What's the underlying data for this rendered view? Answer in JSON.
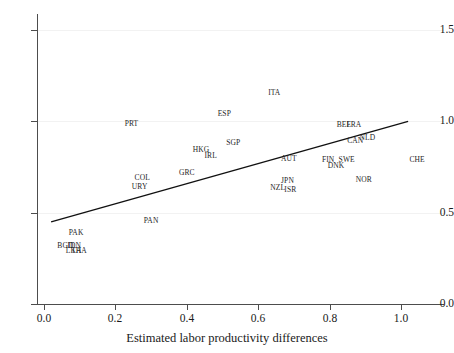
{
  "chart_data": {
    "type": "scatter",
    "title": "",
    "subtitle": "",
    "xlabel": "Estimated labor productivity differences",
    "ylabel": "",
    "xlim": [
      -0.02,
      1.12
    ],
    "ylim": [
      0.0,
      1.58
    ],
    "xticks": [
      "0.0",
      "0.2",
      "0.4",
      "0.6",
      "0.8",
      "1.0"
    ],
    "xtick_values": [
      0.0,
      0.2,
      0.4,
      0.6,
      0.8,
      1.0
    ],
    "yticks": [
      "0.0",
      "0.5",
      "1.0",
      "1.5"
    ],
    "ytick_values": [
      0.0,
      0.5,
      1.0,
      1.5
    ],
    "grid": true,
    "grid_axis": "y",
    "legend": "none",
    "marker_style": "text-label-only",
    "point_label_field": "label",
    "points": [
      {
        "label": "ITA",
        "x": 0.645,
        "y": 1.155
      },
      {
        "label": "ESP",
        "x": 0.505,
        "y": 1.04
      },
      {
        "label": "PRT",
        "x": 0.245,
        "y": 0.985
      },
      {
        "label": "BEL",
        "x": 0.84,
        "y": 0.98
      },
      {
        "label": "FRA",
        "x": 0.868,
        "y": 0.98
      },
      {
        "label": "NLD",
        "x": 0.906,
        "y": 0.91
      },
      {
        "label": "CAN",
        "x": 0.872,
        "y": 0.893
      },
      {
        "label": "SGP",
        "x": 0.53,
        "y": 0.88
      },
      {
        "label": "HKG",
        "x": 0.44,
        "y": 0.843
      },
      {
        "label": "IRL",
        "x": 0.467,
        "y": 0.808
      },
      {
        "label": "AUT",
        "x": 0.686,
        "y": 0.795
      },
      {
        "label": "FIN",
        "x": 0.796,
        "y": 0.79
      },
      {
        "label": "SWE",
        "x": 0.848,
        "y": 0.79
      },
      {
        "label": "CHE",
        "x": 1.045,
        "y": 0.79
      },
      {
        "label": "DNK",
        "x": 0.818,
        "y": 0.757
      },
      {
        "label": "GRC",
        "x": 0.4,
        "y": 0.715
      },
      {
        "label": "COL",
        "x": 0.275,
        "y": 0.69
      },
      {
        "label": "NOR",
        "x": 0.896,
        "y": 0.68
      },
      {
        "label": "JPN",
        "x": 0.682,
        "y": 0.672
      },
      {
        "label": "URY",
        "x": 0.268,
        "y": 0.64
      },
      {
        "label": "NZL",
        "x": 0.655,
        "y": 0.638
      },
      {
        "label": "ISR",
        "x": 0.69,
        "y": 0.625
      },
      {
        "label": "PAN",
        "x": 0.3,
        "y": 0.455
      },
      {
        "label": "PAK",
        "x": 0.09,
        "y": 0.39
      },
      {
        "label": "BGD",
        "x": 0.06,
        "y": 0.32
      },
      {
        "label": "IDN",
        "x": 0.085,
        "y": 0.32
      },
      {
        "label": "LKA",
        "x": 0.083,
        "y": 0.288
      },
      {
        "label": "THA",
        "x": 0.098,
        "y": 0.288
      }
    ],
    "fit_line": {
      "type": "linear-fit",
      "x_start": 0.02,
      "y_start": 0.45,
      "x_end": 1.02,
      "y_end": 1.0
    }
  }
}
